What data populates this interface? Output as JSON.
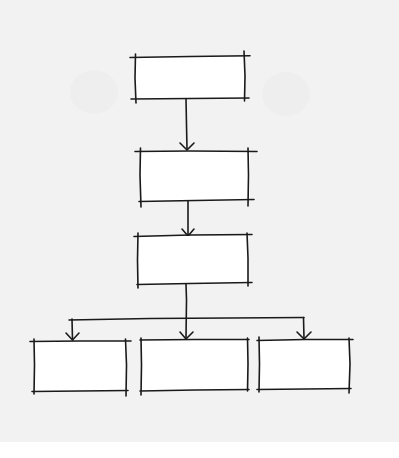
{
  "diagram": {
    "type": "hierarchy-flowchart",
    "style": "hand-drawn",
    "colors": {
      "ink": "#1a1a1a",
      "paper": "#f2f2f2",
      "box_fill": "#ffffff",
      "background": "#ffffff"
    },
    "nodes": [
      {
        "id": "box-1",
        "label": "",
        "level": 1
      },
      {
        "id": "box-2",
        "label": "",
        "level": 2
      },
      {
        "id": "box-3",
        "label": "",
        "level": 3
      },
      {
        "id": "box-4a",
        "label": "",
        "level": 4
      },
      {
        "id": "box-4b",
        "label": "",
        "level": 4
      },
      {
        "id": "box-4c",
        "label": "",
        "level": 4
      }
    ],
    "edges": [
      {
        "from": "box-1",
        "to": "box-2",
        "arrow": true
      },
      {
        "from": "box-2",
        "to": "box-3",
        "arrow": true
      },
      {
        "from": "box-3",
        "to": "box-4a",
        "arrow": true
      },
      {
        "from": "box-3",
        "to": "box-4b",
        "arrow": true
      },
      {
        "from": "box-3",
        "to": "box-4c",
        "arrow": true
      }
    ]
  }
}
